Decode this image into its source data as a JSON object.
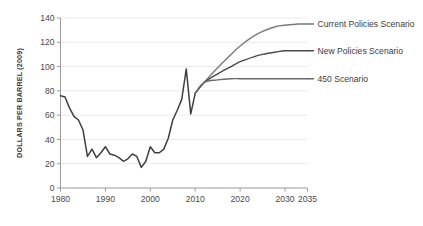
{
  "chart_data": {
    "type": "line",
    "title": "",
    "subtitle": "",
    "xlabel": "",
    "ylabel": "DOLLARS PER BARREL (2009)",
    "xlim": [
      1980,
      2035
    ],
    "ylim": [
      0,
      140
    ],
    "xticks": [
      1980,
      1990,
      2000,
      2010,
      2020,
      2030,
      2035
    ],
    "xtick_labels": [
      "1980",
      "1990",
      "2000",
      "2010",
      "2020",
      "2030",
      "2035"
    ],
    "yticks": [
      0,
      20,
      40,
      60,
      80,
      100,
      120,
      140
    ],
    "ytick_labels": [
      "0",
      "20",
      "40",
      "60",
      "80",
      "100",
      "120",
      "140"
    ],
    "grid": "horizontal",
    "legend_position": "right-inline",
    "colors": {
      "history": "#3f3f3f",
      "current_policies": "#7a7a7a",
      "new_policies": "#4a4a4a",
      "scenario_450": "#6a6a6a",
      "gridline": "#e8e8e8",
      "axis": "#9a9a9a",
      "text": "#3c3c3c",
      "background": "#ffffff"
    },
    "series": [
      {
        "name": "Historical",
        "label": "",
        "color": "#3f3f3f",
        "x": [
          1980,
          1981,
          1982,
          1983,
          1984,
          1985,
          1986,
          1987,
          1988,
          1989,
          1990,
          1991,
          1992,
          1993,
          1994,
          1995,
          1996,
          1997,
          1998,
          1999,
          2000,
          2001,
          2002,
          2003,
          2004,
          2005,
          2006,
          2007,
          2008,
          2009,
          2010
        ],
        "values": [
          76,
          75,
          66,
          59,
          56,
          48,
          26,
          32,
          25,
          29,
          34,
          28,
          27,
          25,
          22,
          24,
          28,
          26,
          17,
          22,
          34,
          29,
          29,
          32,
          41,
          56,
          64,
          73,
          98,
          61,
          78
        ]
      },
      {
        "name": "Current Policies Scenario",
        "label": "Current Policies Scenario",
        "color": "#7a7a7a",
        "x": [
          2010,
          2012,
          2015,
          2018,
          2020,
          2023,
          2025,
          2028,
          2030,
          2033,
          2035
        ],
        "values": [
          78,
          87,
          99,
          110,
          117,
          125,
          129,
          133,
          134,
          135,
          135
        ]
      },
      {
        "name": "New Policies Scenario",
        "label": "New Policies Scenario",
        "color": "#4a4a4a",
        "x": [
          2010,
          2012,
          2015,
          2018,
          2020,
          2023,
          2025,
          2028,
          2030,
          2033,
          2035
        ],
        "values": [
          78,
          87,
          94,
          100,
          104,
          108,
          110,
          112,
          113,
          113,
          113
        ]
      },
      {
        "name": "450 Scenario",
        "label": "450 Scenario",
        "color": "#6a6a6a",
        "x": [
          2010,
          2012,
          2015,
          2018,
          2020,
          2025,
          2030,
          2035
        ],
        "values": [
          78,
          87,
          89,
          90,
          90,
          90,
          90,
          90
        ]
      }
    ],
    "annotations": [
      {
        "text": "Current Policies Scenario",
        "year": 2035,
        "value": 135
      },
      {
        "text": "New Policies Scenario",
        "year": 2035,
        "value": 113
      },
      {
        "text": "450 Scenario",
        "year": 2035,
        "value": 90
      }
    ]
  }
}
